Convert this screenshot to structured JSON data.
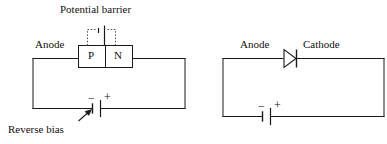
{
  "figure": {
    "title_left": "Potential barrier",
    "caption_left": "Reverse bias"
  },
  "left_circuit": {
    "name": "reverse-biased-pn-junction",
    "anode_label": "Anode",
    "p_region_label": "P",
    "n_region_label": "N",
    "battery": {
      "negative_sign": "−",
      "positive_sign": "+"
    }
  },
  "right_circuit": {
    "name": "diode-symbol-circuit",
    "anode_label": "Anode",
    "cathode_label": "Cathode",
    "battery": {
      "negative_sign": "−",
      "positive_sign": "+"
    }
  },
  "colors": {
    "line": "#1a1a1a",
    "text": "#111111",
    "background": "#ffffff"
  },
  "icons": {
    "diode": "diode-icon",
    "battery": "battery-icon",
    "pointer_arrow": "arrow-pointer-icon",
    "depletion_region": "depletion-region-icon"
  }
}
